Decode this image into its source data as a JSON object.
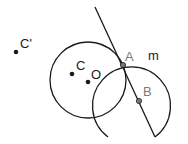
{
  "diagram": {
    "labels": {
      "c_prime": "C'",
      "c": "C",
      "o": "O",
      "a": "A",
      "b": "B",
      "m": "m"
    },
    "colors": {
      "stroke": "#1a1a1a",
      "label_dark": "#1a1a1a",
      "label_gray": "#7a7a7a",
      "point_fill": "#555555"
    }
  }
}
